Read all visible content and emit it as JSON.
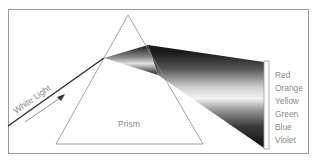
{
  "diagram": {
    "incident_label": "White Light",
    "prism_label": "Prism",
    "spectrum": [
      {
        "label": "Red"
      },
      {
        "label": "Orange"
      },
      {
        "label": "Yellow"
      },
      {
        "label": "Green"
      },
      {
        "label": "Blue"
      },
      {
        "label": "Violet"
      }
    ],
    "colors": {
      "frame": "#9a9a9a",
      "prism_outline": "#8c8c8c",
      "beam_dark": "#1e1e1e",
      "beam_light": "#e8e8e8",
      "label_text": "#8a8a8a"
    }
  }
}
